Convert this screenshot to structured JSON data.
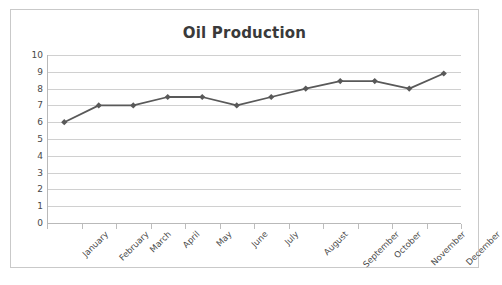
{
  "chart_data": {
    "type": "line",
    "title": "Oil Production",
    "xlabel": "",
    "ylabel": "",
    "categories": [
      "January",
      "February",
      "March",
      "April",
      "May",
      "June",
      "July",
      "August",
      "September",
      "October",
      "November",
      "December"
    ],
    "values": [
      6.0,
      7.0,
      7.0,
      7.5,
      7.5,
      7.0,
      7.5,
      8.0,
      8.45,
      8.45,
      8.0,
      8.9
    ],
    "series": [
      {
        "name": "Oil Production",
        "values": [
          6.0,
          7.0,
          7.0,
          7.5,
          7.5,
          7.0,
          7.5,
          8.0,
          8.45,
          8.45,
          8.0,
          8.9
        ]
      }
    ],
    "ylim": [
      0,
      10
    ],
    "y_ticks": [
      0,
      1,
      2,
      3,
      4,
      5,
      6,
      7,
      8,
      9,
      10
    ],
    "y_tick_labels": [
      "0",
      "1",
      "2",
      "3",
      "4",
      "5",
      "6",
      "7",
      "8",
      "9",
      "10"
    ],
    "grid": true,
    "grid_axis": "y",
    "legend": false,
    "legend_position": "none",
    "marker": "diamond",
    "line_color": "#595959",
    "marker_color": "#595959",
    "grid_color": "#d0d0d0",
    "text_color": "#4a4a4a",
    "title_color": "#3a3a3a",
    "plot_background": "#ffffff",
    "border_color": "#c9c9c9"
  }
}
